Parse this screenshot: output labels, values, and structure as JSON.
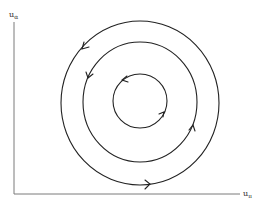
{
  "diagram": {
    "type": "phase-plane orbits",
    "axes": {
      "y_label": {
        "base": "u",
        "sub": "α"
      },
      "x_label": {
        "base": "u",
        "sub": "ıı"
      },
      "color": "#7a7a7a"
    },
    "circles": [
      {
        "name": "outer-orbit",
        "cx": 140,
        "cy": 103,
        "r": 81,
        "direction": "counterclockwise"
      },
      {
        "name": "middle-orbit",
        "cx": 140,
        "cy": 102,
        "r": 58,
        "direction": "counterclockwise"
      },
      {
        "name": "inner-orbit",
        "cx": 140,
        "cy": 101,
        "r": 27,
        "direction": "counterclockwise"
      }
    ],
    "stroke_color": "#222222"
  }
}
